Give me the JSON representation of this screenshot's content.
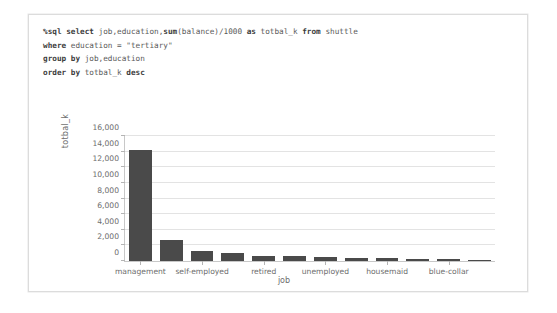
{
  "notebook": {
    "code_lines": [
      [
        {
          "t": "%sql select ",
          "b": true
        },
        {
          "t": "job,education,",
          "b": false
        },
        {
          "t": "sum",
          "b": true
        },
        {
          "t": "(balance)/1000 ",
          "b": false
        },
        {
          "t": "as ",
          "b": true
        },
        {
          "t": "totbal_k ",
          "b": false
        },
        {
          "t": "from ",
          "b": true
        },
        {
          "t": "shuttle",
          "b": false
        }
      ],
      [
        {
          "t": "where ",
          "b": true
        },
        {
          "t": "education = \"tertiary\"",
          "b": false
        }
      ],
      [
        {
          "t": "group by ",
          "b": true
        },
        {
          "t": "job,education",
          "b": false
        }
      ],
      [
        {
          "t": "order by ",
          "b": true
        },
        {
          "t": "totbal_k ",
          "b": false
        },
        {
          "t": "desc",
          "b": true
        }
      ]
    ],
    "bar_color": "#4a4a4a",
    "grid_color": "#e3e3e3",
    "axis_color": "#c8c8c8",
    "text_color": "#6d6d6d"
  },
  "chart_data": {
    "type": "bar",
    "title": "",
    "xlabel": "job",
    "ylabel": "totbal_k",
    "ylim": [
      0,
      16000
    ],
    "yticks": [
      0,
      2000,
      4000,
      6000,
      8000,
      10000,
      12000,
      14000,
      16000
    ],
    "ytick_labels": [
      "0",
      "2,000",
      "4,000",
      "6,000",
      "8,000",
      "10,000",
      "12,000",
      "14,000",
      "16,000"
    ],
    "grid": true,
    "legend": "none",
    "categories": [
      "management",
      "technician",
      "self-employed",
      "admin.",
      "retired",
      "services",
      "unemployed",
      "entrepreneur",
      "housemaid",
      "student",
      "blue-collar",
      "unknown"
    ],
    "tick_labels": [
      "management",
      "self-employed",
      "retired",
      "unemployed",
      "housemaid",
      "blue-collar"
    ],
    "tick_indices": [
      0,
      2,
      4,
      6,
      8,
      10
    ],
    "values": [
      14200,
      2700,
      1250,
      1050,
      700,
      620,
      500,
      420,
      360,
      300,
      230,
      120
    ]
  }
}
